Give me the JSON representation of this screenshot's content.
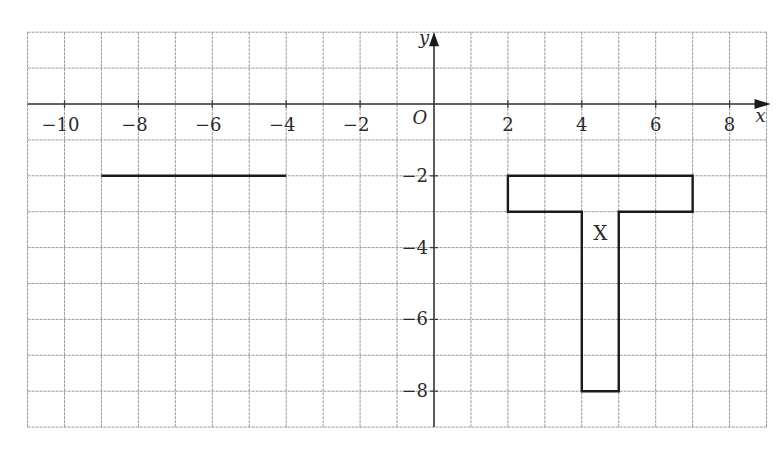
{
  "figure": {
    "x_range": [
      -11,
      9
    ],
    "y_range": [
      -9,
      2
    ],
    "origin_label": "O",
    "x_axis_label": "x",
    "y_axis_label": "y",
    "x_ticks": [
      {
        "value": -10,
        "label": "−10"
      },
      {
        "value": -8,
        "label": "−8"
      },
      {
        "value": -6,
        "label": "−6"
      },
      {
        "value": -4,
        "label": "−4"
      },
      {
        "value": -2,
        "label": "−2"
      },
      {
        "value": 2,
        "label": "2"
      },
      {
        "value": 4,
        "label": "4"
      },
      {
        "value": 6,
        "label": "6"
      },
      {
        "value": 8,
        "label": "8"
      }
    ],
    "y_ticks": [
      {
        "value": -2,
        "label": "−2"
      },
      {
        "value": -4,
        "label": "−4"
      },
      {
        "value": -6,
        "label": "−6"
      },
      {
        "value": -8,
        "label": "−8"
      }
    ],
    "shapes": [
      {
        "name": "shape-x",
        "label": "X",
        "label_pos": [
          4.5,
          -3.6
        ],
        "points": [
          [
            2,
            -2
          ],
          [
            7,
            -2
          ],
          [
            7,
            -3
          ],
          [
            5,
            -3
          ],
          [
            5,
            -8
          ],
          [
            4,
            -8
          ],
          [
            4,
            -3
          ],
          [
            2,
            -3
          ]
        ]
      }
    ],
    "segments": [
      {
        "name": "line-segment",
        "from": [
          -9,
          -2
        ],
        "to": [
          -4,
          -2
        ]
      }
    ],
    "colors": {
      "grid": "#9a9a9a",
      "axis": "#3a3a3a",
      "shape": "#1a1a1a"
    }
  }
}
